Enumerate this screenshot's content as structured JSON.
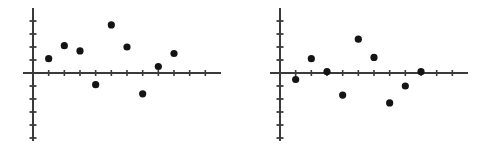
{
  "figure": {
    "background_color": "#ffffff",
    "axis_color": "#3a3a3a",
    "point_color": "#141414",
    "width": 494,
    "height": 147
  },
  "chart_data": [
    {
      "type": "scatter",
      "title": "",
      "subtitle": "",
      "xlabel": "",
      "ylabel": "",
      "name": "residual-plot-left",
      "grid": false,
      "legend": null,
      "annotations": [],
      "xlim": [
        -1,
        12
      ],
      "ylim": [
        -6,
        5
      ],
      "x_axis_y_value": 0,
      "y_axis_x_value": 0,
      "xticks": [
        1,
        2,
        3,
        4,
        5,
        6,
        7,
        8,
        9,
        10,
        11
      ],
      "yticks": [
        -5,
        -4,
        -3,
        -2,
        -1,
        1,
        2,
        3,
        4
      ],
      "xtick_labels": [],
      "ytick_labels": [],
      "x": [
        1,
        2,
        3,
        4,
        5,
        6,
        7,
        8,
        9,
        10
      ],
      "y": [
        1.1,
        2.1,
        1.7,
        -0.9,
        3.7,
        2.0,
        -1.6,
        0.5,
        1.5,
        0.0
      ],
      "points": [
        {
          "x": 1,
          "y": 1.1
        },
        {
          "x": 2,
          "y": 2.1
        },
        {
          "x": 3,
          "y": 1.7
        },
        {
          "x": 4,
          "y": -0.9
        },
        {
          "x": 5,
          "y": 3.7
        },
        {
          "x": 6,
          "y": 2.0
        },
        {
          "x": 7,
          "y": -1.6
        },
        {
          "x": 8,
          "y": 0.5
        },
        {
          "x": 9,
          "y": 1.5
        }
      ]
    },
    {
      "type": "scatter",
      "title": "",
      "subtitle": "",
      "xlabel": "",
      "ylabel": "",
      "name": "residual-plot-right",
      "grid": false,
      "legend": null,
      "annotations": [],
      "xlim": [
        -1,
        12
      ],
      "ylim": [
        -6,
        5
      ],
      "x_axis_y_value": 0,
      "y_axis_x_value": 0,
      "xticks": [
        1,
        2,
        3,
        4,
        5,
        6,
        7,
        8,
        9,
        10,
        11
      ],
      "yticks": [
        -5,
        -4,
        -3,
        -2,
        -1,
        1,
        2,
        3,
        4
      ],
      "xtick_labels": [],
      "ytick_labels": [],
      "x": [
        1,
        2,
        3,
        4,
        5,
        6,
        7,
        8,
        9,
        10
      ],
      "y": [
        -0.5,
        1.1,
        0.1,
        -1.7,
        2.6,
        1.2,
        -2.3,
        -1.0,
        0.1,
        0.0
      ],
      "points": [
        {
          "x": 1,
          "y": -0.5
        },
        {
          "x": 2,
          "y": 1.1
        },
        {
          "x": 3,
          "y": 0.1
        },
        {
          "x": 4,
          "y": -1.7
        },
        {
          "x": 5,
          "y": 2.6
        },
        {
          "x": 6,
          "y": 1.2
        },
        {
          "x": 7,
          "y": -2.3
        },
        {
          "x": 8,
          "y": -1.0
        },
        {
          "x": 9,
          "y": 0.1
        }
      ]
    }
  ]
}
